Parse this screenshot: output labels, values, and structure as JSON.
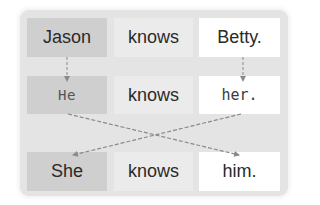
{
  "diagram": {
    "title": "",
    "rows": [
      {
        "subject": "Jason",
        "verb": "knows",
        "object": "Betty."
      },
      {
        "subject": "He",
        "verb": "knows",
        "object": "her."
      },
      {
        "subject": "She",
        "verb": "knows",
        "object": "him."
      }
    ],
    "arrows": [
      {
        "from": "Jason",
        "to": "He",
        "style": "dashed"
      },
      {
        "from": "Betty.",
        "to": "her.",
        "style": "dashed"
      },
      {
        "from": "He",
        "to": "him.",
        "style": "dashed"
      },
      {
        "from": "her.",
        "to": "She",
        "style": "dashed"
      }
    ],
    "colors": {
      "panel": "#e4e4e4",
      "subject_cell": "#cfcfcf",
      "verb_cell": "#ebebeb",
      "object_cell": "#ffffff",
      "arrow": "#8a8a8a",
      "text": "#2a2a2a"
    }
  }
}
